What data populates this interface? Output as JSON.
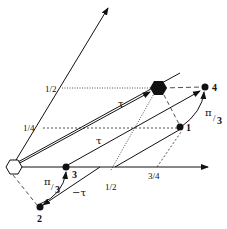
{
  "diagram": {
    "axes": {
      "origin": {
        "shape": "hexagon-open"
      },
      "x_axis": {
        "ticks": [
          "1/2",
          "3/4"
        ]
      },
      "y_axis": {
        "ticks": [
          "1/4",
          "1/2"
        ]
      }
    },
    "points": [
      {
        "id": "1",
        "label": "1"
      },
      {
        "id": "2",
        "label": "2"
      },
      {
        "id": "3",
        "label": "3"
      },
      {
        "id": "4",
        "label": "4"
      },
      {
        "id": "hex",
        "label": "",
        "shape": "hexagon-filled"
      }
    ],
    "vector_labels": {
      "tau_upper": "τ",
      "tau_lower": "τ",
      "neg_tau": "−τ"
    },
    "rotation_labels": {
      "right": {
        "num": "π",
        "den": "3"
      },
      "left": {
        "num": "π",
        "den": "3"
      }
    }
  }
}
